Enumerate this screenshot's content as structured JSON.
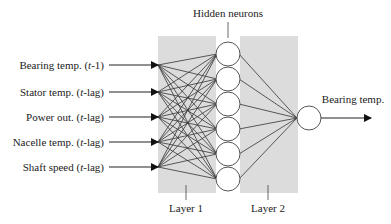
{
  "diagram": {
    "title_hidden": "Hidden neurons",
    "layer1_label": "Layer 1",
    "layer2_label": "Layer 2",
    "output_label": "Bearing temp.",
    "inputs": [
      {
        "label": "Bearing temp. (",
        "italic": "t",
        "suffix": "-1)"
      },
      {
        "label": "Stator temp. (",
        "italic": "t",
        "suffix": "-lag)"
      },
      {
        "label": "Power out. (",
        "italic": "t",
        "suffix": "-lag)"
      },
      {
        "label": "Nacelle temp. (",
        "italic": "t",
        "suffix": "-lag)"
      },
      {
        "label": "Shaft speed (",
        "italic": "t",
        "suffix": "-lag)"
      }
    ],
    "hidden_neuron_count": 6,
    "colors": {
      "layer_fill": "#dcdcdc",
      "line": "#333333",
      "neuron_stroke": "#555555"
    }
  }
}
